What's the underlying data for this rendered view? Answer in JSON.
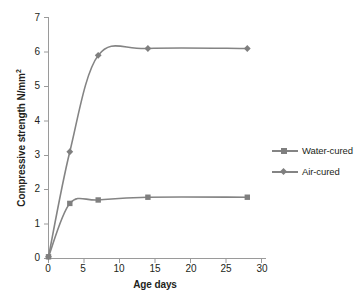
{
  "chart_data": {
    "type": "line",
    "title": "",
    "xlabel": "Age days",
    "ylabel": "Compressive strength N/mm²",
    "xlim": [
      0,
      30
    ],
    "ylim": [
      0,
      7
    ],
    "xticks": [
      "0",
      "5",
      "10",
      "15",
      "20",
      "25",
      "30"
    ],
    "yticks": [
      "0",
      "1",
      "2",
      "3",
      "4",
      "5",
      "6",
      "7"
    ],
    "grid": false,
    "smoothed": true,
    "legend_position": "right",
    "line_color": "#848484",
    "marker_color": "#7f7f7f",
    "x": [
      0,
      3,
      7,
      14,
      28
    ],
    "series": [
      {
        "name": "Water-cured",
        "marker": "square",
        "values": [
          0.05,
          1.6,
          1.7,
          1.78,
          1.78
        ]
      },
      {
        "name": "Air-cured",
        "marker": "diamond",
        "values": [
          0.05,
          3.1,
          5.9,
          6.1,
          6.1
        ]
      }
    ]
  },
  "axes": {
    "y_title_main": "Compressive strength N/mm",
    "y_title_sup": "2",
    "x_title": "Age days",
    "y_tick_labels": [
      "7",
      "6",
      "5",
      "4",
      "3",
      "2",
      "1",
      "0"
    ],
    "x_tick_labels": [
      "0",
      "5",
      "10",
      "15",
      "20",
      "25",
      "30"
    ]
  },
  "legend": {
    "items": [
      {
        "label": "Water-cured",
        "marker": "square-marker"
      },
      {
        "label": "Air-cured",
        "marker": "diamond-marker"
      }
    ]
  }
}
